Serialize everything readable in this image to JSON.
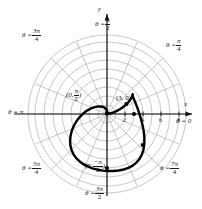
{
  "figure": {
    "type": "polar-plot",
    "curve_name": "cardioid",
    "curve_equation": "r = 3(1 - sin(theta))",
    "axes": {
      "x_axis_label": "x",
      "y_axis_label": "y",
      "x_tick_labels": [
        "2",
        "4",
        "6",
        "8"
      ],
      "x_tick_values": [
        2,
        4,
        6,
        8
      ]
    },
    "grid": {
      "rings": [
        1,
        2,
        3,
        4,
        5,
        6,
        7,
        8,
        9
      ],
      "spoke_step": "pi/8",
      "grid_color": "#9a9a9a",
      "axis_color": "#111111",
      "curve_color": "#000000"
    },
    "angle_labels": [
      {
        "name": "theta-0",
        "theta_text": "θ = 0",
        "num": "",
        "den": "",
        "value_pi": 0
      },
      {
        "name": "theta-pi-4",
        "theta_text": "θ =",
        "num": "π",
        "den": "4",
        "value_pi": 0.25
      },
      {
        "name": "theta-pi-2",
        "theta_text": "θ =",
        "num": "π",
        "den": "2",
        "value_pi": 0.5
      },
      {
        "name": "theta-3pi-4",
        "theta_text": "θ =",
        "num": "3π",
        "den": "4",
        "value_pi": 0.75
      },
      {
        "name": "theta-pi",
        "theta_text": "θ = π",
        "num": "",
        "den": "",
        "value_pi": 1
      },
      {
        "name": "theta-5pi-4",
        "theta_text": "θ =",
        "num": "5π",
        "den": "4",
        "value_pi": 1.25
      },
      {
        "name": "theta-3pi-2",
        "theta_text": "θ =",
        "num": "3π",
        "den": "2",
        "value_pi": 1.5
      },
      {
        "name": "theta-7pi-4",
        "theta_text": "θ =",
        "num": "7π",
        "den": "4",
        "value_pi": 1.75
      }
    ],
    "point_labels": [
      {
        "name": "point-0-pi-over-2",
        "open": "(0,",
        "num": "π",
        "den": "2",
        "close": ")",
        "r": 0,
        "theta_pi": 0.5
      },
      {
        "name": "point-3-0",
        "text": "(3, 0)",
        "r": 3,
        "theta_pi": 0
      },
      {
        "name": "point-6-neg-pi-over-2",
        "open": "(6,",
        "num": "−π",
        "den": "2",
        "close": ")",
        "r": 6,
        "theta_pi": -0.5
      }
    ],
    "marked_points": [
      {
        "name": "marker-cusp",
        "r": 0,
        "theta_deg": 90
      },
      {
        "name": "marker-right",
        "r": 3,
        "theta_deg": 0
      },
      {
        "name": "marker-lower-right",
        "r": 5.1,
        "theta_deg": -45
      },
      {
        "name": "marker-bottom",
        "r": 6,
        "theta_deg": -90
      },
      {
        "name": "marker-upper-right",
        "r": 1.7,
        "theta_deg": 22
      }
    ]
  }
}
